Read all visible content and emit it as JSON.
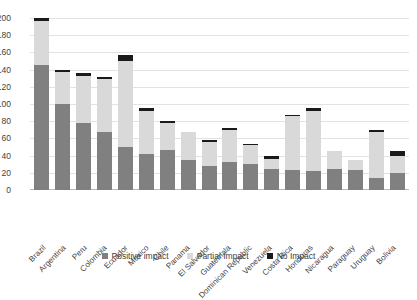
{
  "chart_data": {
    "type": "bar",
    "title": "",
    "subtitle": "",
    "xlabel": "",
    "ylabel": "",
    "stacked": true,
    "grid": true,
    "legend_position": "bottom",
    "ylim": [
      0,
      200
    ],
    "yticks": [
      200,
      180,
      160,
      140,
      120,
      100,
      80,
      60,
      40,
      20,
      0
    ],
    "categories": [
      "Brazil",
      "Argentina",
      "Peru",
      "Colombia",
      "Ecuador",
      "Mexico",
      "Chile",
      "Panama",
      "El Salvador",
      "Guatemala",
      "Dominican Republic",
      "Venezuela",
      "Costa Rica",
      "Honduras",
      "Nicaragua",
      "Paraguay",
      "Uruguay",
      "Bolivia"
    ],
    "series": [
      {
        "name": "Positive impact",
        "color": "#808080",
        "values": [
          145,
          100,
          78,
          68,
          50,
          42,
          46,
          35,
          28,
          32,
          30,
          25,
          23,
          22,
          25,
          23,
          14,
          20
        ]
      },
      {
        "name": "Partial Impact",
        "color": "#d9d9d9",
        "values": [
          52,
          37,
          55,
          61,
          100,
          50,
          32,
          33,
          28,
          38,
          22,
          11,
          63,
          70,
          20,
          12,
          54,
          19
        ]
      },
      {
        "name": "No Impact",
        "color": "#1a1a1a",
        "values": [
          3,
          3,
          3,
          3,
          7,
          3,
          2,
          0,
          2,
          2,
          2,
          4,
          1,
          3,
          0,
          0,
          2,
          6
        ]
      }
    ],
    "totals": [
      200,
      140,
      136,
      132,
      157,
      95,
      80,
      68,
      58,
      72,
      54,
      40,
      87,
      95,
      45,
      35,
      70,
      45
    ]
  },
  "legend": {
    "items": [
      {
        "label": "Positive impact",
        "color": "#808080"
      },
      {
        "label": "Partial Impact",
        "color": "#d9d9d9"
      },
      {
        "label": "No Impact",
        "color": "#1a1a1a"
      }
    ]
  }
}
